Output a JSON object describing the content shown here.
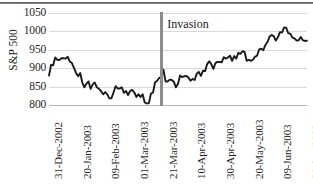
{
  "chart_data": {
    "type": "line",
    "title": "",
    "xlabel": "",
    "ylabel": "S&P 500",
    "ylim": [
      800,
      1050
    ],
    "yticks": [
      800,
      850,
      900,
      950,
      1000,
      1050
    ],
    "grid": true,
    "legend": null,
    "xlim": [
      "31-Dec-2002",
      "29-Jun-2003"
    ],
    "xticks": [
      "31-Dec-2002",
      "20-Jan-2003",
      "09-Feb-2003",
      "01-Mar-2003",
      "21-Mar-2003",
      "10-Apr-2003",
      "30-Apr-2003",
      "20-May-2003",
      "09-Jun-2003",
      "29-Jun-2003"
    ],
    "annotations": [
      {
        "name": "invasion-marker",
        "label": "Invasion",
        "x": "20-Mar-2003",
        "color": "#8c8c8c",
        "style": "vertical-line"
      }
    ],
    "series": [
      {
        "name": "S&P 500 close",
        "color": "#1a1a1a",
        "x": [
          "31-Dec-2002",
          "02-Jan-2003",
          "03-Jan-2003",
          "06-Jan-2003",
          "07-Jan-2003",
          "08-Jan-2003",
          "09-Jan-2003",
          "10-Jan-2003",
          "13-Jan-2003",
          "14-Jan-2003",
          "15-Jan-2003",
          "16-Jan-2003",
          "17-Jan-2003",
          "21-Jan-2003",
          "22-Jan-2003",
          "23-Jan-2003",
          "24-Jan-2003",
          "27-Jan-2003",
          "28-Jan-2003",
          "29-Jan-2003",
          "30-Jan-2003",
          "31-Jan-2003",
          "03-Feb-2003",
          "04-Feb-2003",
          "05-Feb-2003",
          "06-Feb-2003",
          "07-Feb-2003",
          "10-Feb-2003",
          "11-Feb-2003",
          "12-Feb-2003",
          "13-Feb-2003",
          "14-Feb-2003",
          "18-Feb-2003",
          "19-Feb-2003",
          "20-Feb-2003",
          "21-Feb-2003",
          "24-Feb-2003",
          "25-Feb-2003",
          "26-Feb-2003",
          "27-Feb-2003",
          "28-Feb-2003",
          "03-Mar-2003",
          "04-Mar-2003",
          "05-Mar-2003",
          "06-Mar-2003",
          "07-Mar-2003",
          "10-Mar-2003",
          "11-Mar-2003",
          "12-Mar-2003",
          "13-Mar-2003",
          "14-Mar-2003",
          "17-Mar-2003",
          "18-Mar-2003",
          "19-Mar-2003",
          "20-Mar-2003",
          "21-Mar-2003",
          "24-Mar-2003",
          "25-Mar-2003",
          "26-Mar-2003",
          "27-Mar-2003",
          "28-Mar-2003",
          "31-Mar-2003",
          "01-Apr-2003",
          "02-Apr-2003",
          "03-Apr-2003",
          "04-Apr-2003",
          "07-Apr-2003",
          "08-Apr-2003",
          "09-Apr-2003",
          "10-Apr-2003",
          "11-Apr-2003",
          "14-Apr-2003",
          "15-Apr-2003",
          "16-Apr-2003",
          "17-Apr-2003",
          "21-Apr-2003",
          "22-Apr-2003",
          "23-Apr-2003",
          "24-Apr-2003",
          "25-Apr-2003",
          "28-Apr-2003",
          "29-Apr-2003",
          "30-Apr-2003",
          "01-May-2003",
          "02-May-2003",
          "05-May-2003",
          "06-May-2003",
          "07-May-2003",
          "08-May-2003",
          "09-May-2003",
          "12-May-2003",
          "13-May-2003",
          "14-May-2003",
          "15-May-2003",
          "16-May-2003",
          "19-May-2003",
          "20-May-2003",
          "21-May-2003",
          "22-May-2003",
          "23-May-2003",
          "27-May-2003",
          "28-May-2003",
          "29-May-2003",
          "30-May-2003",
          "02-Jun-2003",
          "03-Jun-2003",
          "04-Jun-2003",
          "05-Jun-2003",
          "06-Jun-2003",
          "09-Jun-2003",
          "10-Jun-2003",
          "11-Jun-2003",
          "12-Jun-2003",
          "13-Jun-2003",
          "16-Jun-2003",
          "17-Jun-2003",
          "18-Jun-2003",
          "19-Jun-2003",
          "20-Jun-2003",
          "23-Jun-2003",
          "24-Jun-2003",
          "25-Jun-2003",
          "26-Jun-2003",
          "27-Jun-2003",
          "29-Jun-2003"
        ],
        "values": [
          880,
          909,
          908,
          929,
          923,
          922,
          927,
          927,
          926,
          931,
          918,
          914,
          901,
          887,
          878,
          887,
          861,
          848,
          858,
          864,
          844,
          856,
          861,
          848,
          844,
          838,
          829,
          835,
          829,
          818,
          818,
          834,
          851,
          845,
          845,
          848,
          833,
          838,
          827,
          838,
          841,
          834,
          822,
          829,
          822,
          829,
          807,
          804,
          805,
          831,
          834,
          862,
          866,
          874,
          875,
          896,
          864,
          864,
          869,
          868,
          863,
          848,
          858,
          880,
          876,
          878,
          879,
          875,
          866,
          871,
          868,
          885,
          890,
          879,
          893,
          892,
          911,
          919,
          911,
          898,
          914,
          917,
          917,
          916,
          930,
          926,
          929,
          934,
          920,
          933,
          926,
          942,
          939,
          946,
          944,
          920,
          923,
          920,
          923,
          931,
          934,
          951,
          953,
          949,
          963,
          971,
          986,
          990,
          987,
          975,
          984,
          998,
          997,
          1011,
          1010,
          995,
          994,
          983,
          981,
          975,
          976,
          985,
          976,
          974,
          975
        ]
      }
    ]
  }
}
